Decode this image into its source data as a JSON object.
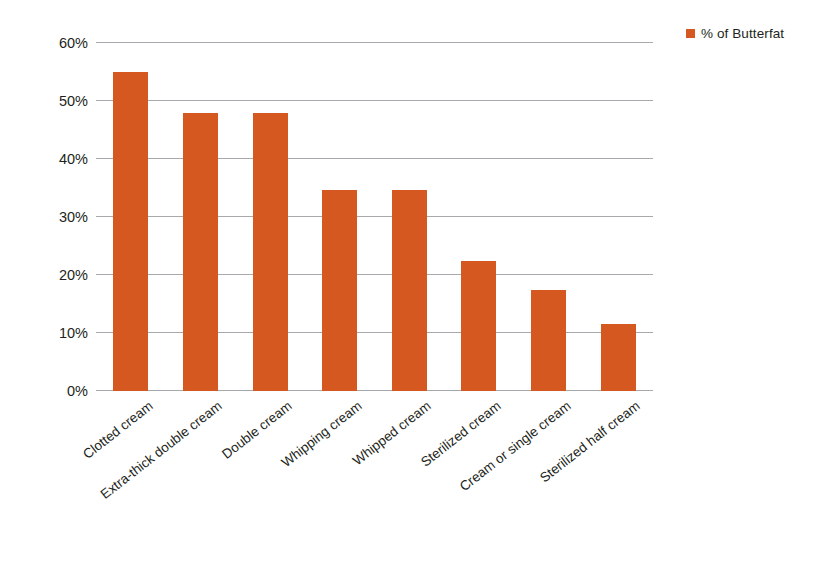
{
  "chart_data": {
    "type": "bar",
    "title": "",
    "subtitle": "",
    "xlabel": "",
    "ylabel": "",
    "categories": [
      "Clotted cream",
      "Extra-thick double cream",
      "Double cream",
      "Whipping cream",
      "Whipped cream",
      "Sterilized cream",
      "Cream or single cream",
      "Sterilized half cream"
    ],
    "values": [
      55,
      48,
      48,
      34.7,
      34.7,
      22.5,
      17.5,
      11.5
    ],
    "series": [
      {
        "name": "% of Butterfat",
        "color": "#d4581f",
        "values": [
          55,
          48,
          48,
          34.7,
          34.7,
          22.5,
          17.5,
          11.5
        ]
      }
    ],
    "ylim": [
      0,
      60
    ],
    "ytick_values": [
      0,
      10,
      20,
      30,
      40,
      50,
      60
    ],
    "ytick_labels": [
      "0%",
      "10%",
      "20%",
      "30%",
      "40%",
      "50%",
      "60%"
    ],
    "grid": true,
    "grid_axis": "y",
    "legend_position": "top-right",
    "bar_color": "#d4581f",
    "grid_color": "#a7a9ac",
    "text_color": "#231f20",
    "background": "#ffffff"
  },
  "legend": {
    "entries": [
      {
        "label": "% of Butterfat",
        "color": "#d4581f",
        "marker": "square-swatch"
      }
    ]
  }
}
